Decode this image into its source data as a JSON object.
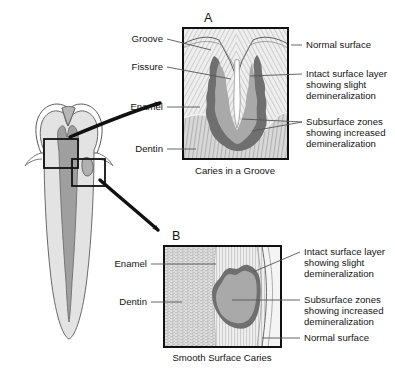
{
  "figure": {
    "title_overview": "Tooth cross-section with caries detail panels",
    "colors": {
      "outline": "#1a1a1a",
      "enamel_fill": "#e8e8e8",
      "dentin_fill": "#c9c9c9",
      "pulp_fill": "#9d9d9d",
      "lesion_dark": "#707070",
      "lesion_body": "#a8a8a8",
      "hatch": "#b4b4b4",
      "leader": "#555555",
      "text": "#141414",
      "background": "#ffffff"
    }
  },
  "overview": {
    "name": "tooth-cross-section",
    "box_a_label": "groove-detail-box",
    "box_b_label": "smooth-surface-detail-box",
    "arrow_a": "arrow-to-panel-a",
    "arrow_b": "arrow-to-panel-b"
  },
  "panel_a": {
    "letter": "A",
    "caption": "Caries in a Groove",
    "labels_left": [
      {
        "text": "Groove"
      },
      {
        "text": "Fissure"
      },
      {
        "text": "Enamel"
      },
      {
        "text": "Dentin"
      }
    ],
    "labels_right": [
      {
        "lines": [
          "Normal surface"
        ]
      },
      {
        "lines": [
          "Intact surface layer",
          "showing slight",
          "demineralization"
        ]
      },
      {
        "lines": [
          "Subsurface zones",
          "showing increased",
          "demineralization"
        ]
      }
    ]
  },
  "panel_b": {
    "letter": "B",
    "caption": "Smooth Surface Caries",
    "labels_left": [
      {
        "text": "Enamel"
      },
      {
        "text": "Dentin"
      }
    ],
    "labels_right": [
      {
        "lines": [
          "Intact surface layer",
          "showing slight",
          "demineralization"
        ]
      },
      {
        "lines": [
          "Subsurface zones",
          "showing increased",
          "demineralization"
        ]
      },
      {
        "lines": [
          "Normal surface"
        ]
      }
    ]
  }
}
